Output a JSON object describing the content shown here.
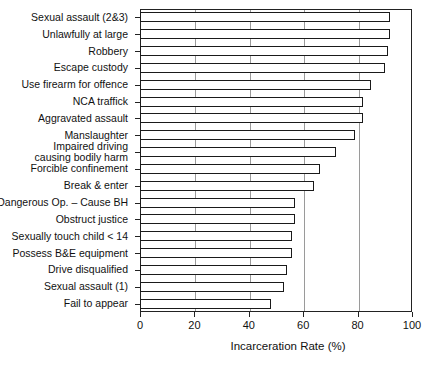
{
  "chart_data": {
    "type": "bar",
    "orientation": "horizontal",
    "title": "",
    "xlabel": "Incarceration Rate (%)",
    "ylabel": "",
    "xlim": [
      0,
      100
    ],
    "xticks": [
      0,
      20,
      40,
      60,
      80,
      100
    ],
    "grid": "vertical",
    "legend": null,
    "categories": [
      "Sexual assault (2&3)",
      "Unlawfully at large",
      "Robbery",
      "Escape custody",
      "Use firearm for offence",
      "NCA traffick",
      "Aggravated assault",
      "Manslaughter",
      "Impaired driving\ncausing bodily harm",
      "Forcible confinement",
      "Break & enter",
      "Dangerous Op. – Cause BH",
      "Obstruct justice",
      "Sexually touch child < 14",
      "Possess B&E equipment",
      "Drive disqualified",
      "Sexual assault (1)",
      "Fail to appear"
    ],
    "values": [
      92,
      92,
      91,
      90,
      85,
      82,
      82,
      79,
      72,
      66,
      64,
      57,
      57,
      56,
      56,
      54,
      53,
      48
    ]
  },
  "axis": {
    "x_title": "Incarceration Rate (%)",
    "x_tick_labels": [
      "0",
      "20",
      "40",
      "60",
      "80",
      "100"
    ]
  },
  "colors": {
    "bar_fill": "#ffffff",
    "bar_stroke": "#1a1a1a",
    "grid": "#9a9a9a",
    "axis": "#222222",
    "text": "#111111",
    "background": "#ffffff"
  }
}
